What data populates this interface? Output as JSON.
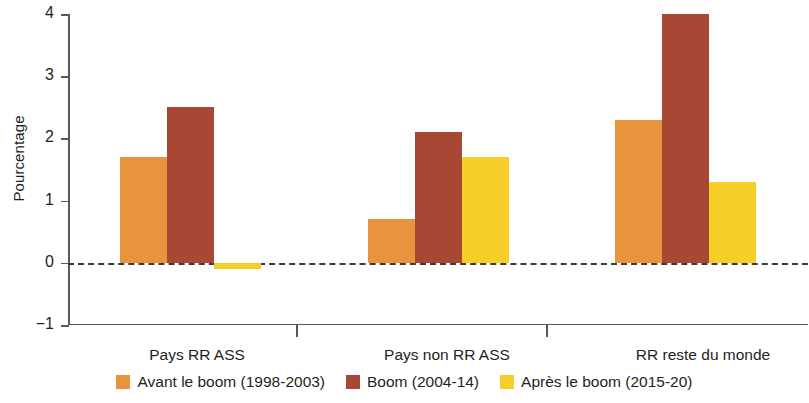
{
  "chart_data": {
    "type": "bar",
    "title": "",
    "subtitle": "",
    "xlabel": "",
    "ylabel": "Pourcentage",
    "ylim": [
      -1,
      4
    ],
    "yticks": [
      4,
      3,
      2,
      1,
      0,
      -1
    ],
    "ytick_labels": [
      "4",
      "3",
      "2",
      "1",
      "0",
      "−1"
    ],
    "grid": false,
    "zero_line": true,
    "legend_position": "bottom",
    "categories": [
      "Pays RR ASS",
      "Pays non RR ASS",
      "RR reste du monde"
    ],
    "series": [
      {
        "name": "Avant le boom (1998-2003)",
        "color": "#E8943C",
        "values": [
          1.7,
          0.7,
          2.3
        ]
      },
      {
        "name": "Boom (2004-14)",
        "color": "#A84734",
        "values": [
          2.5,
          2.1,
          4.0
        ]
      },
      {
        "name": "Après le boom (2015-20)",
        "color": "#F5CE27",
        "values": [
          -0.1,
          1.7,
          1.3
        ]
      }
    ]
  },
  "axis": {
    "y_title": "Pourcentage",
    "tick_4": "4",
    "tick_3": "3",
    "tick_2": "2",
    "tick_1": "1",
    "tick_0": "0",
    "tick_neg1": "−1"
  },
  "categories": {
    "c0": "Pays RR ASS",
    "c1": "Pays non RR ASS",
    "c2": "RR reste du monde"
  },
  "legend": {
    "items": [
      {
        "label": "Avant le boom (1998-2003)",
        "color": "#E8943C",
        "swatch": "square-swatch-orange"
      },
      {
        "label": "Boom (2004-14)",
        "color": "#A84734",
        "swatch": "square-swatch-darkred"
      },
      {
        "label": "Après le boom (2015-20)",
        "color": "#F5CE27",
        "swatch": "square-swatch-yellow"
      }
    ]
  }
}
